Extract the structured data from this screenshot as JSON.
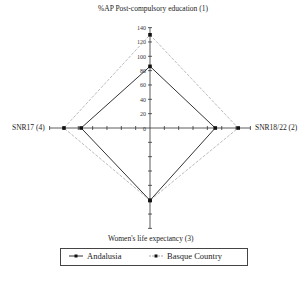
{
  "chart_data": {
    "type": "radar",
    "title": "",
    "axes": [
      {
        "id": 1,
        "label": "%AP Post-compulsory education (1)",
        "direction": "top"
      },
      {
        "id": 2,
        "label": "SNR18/22 (2)",
        "direction": "right"
      },
      {
        "id": 3,
        "label": "Women's life expectancy (3)",
        "direction": "bottom"
      },
      {
        "id": 4,
        "label": "SNR17 (4)",
        "direction": "left"
      }
    ],
    "ticks": [
      0,
      20,
      40,
      60,
      80,
      100,
      120,
      140
    ],
    "range": [
      0,
      140
    ],
    "series": [
      {
        "name": "Andalusia",
        "values": [
          86,
          91,
          101,
          96
        ],
        "color": "#333333",
        "style": "solid"
      },
      {
        "name": "Basque Country",
        "values": [
          130,
          123,
          101,
          120
        ],
        "color": "#aaaaaa",
        "style": "dashed"
      }
    ],
    "legend_position": "bottom"
  },
  "labels": {
    "top": "%AP Post-compulsory education (1)",
    "right": "SNR18/22 (2)",
    "bottom": "Women's life expectancy (3)",
    "left": "SNR17 (4)"
  },
  "legend": {
    "items": [
      {
        "name": "Andalusia"
      },
      {
        "name": "Basque Country"
      }
    ]
  }
}
